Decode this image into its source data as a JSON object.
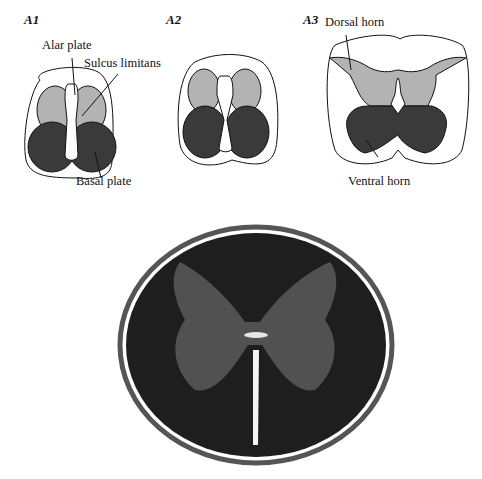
{
  "figure": {
    "panels": [
      {
        "id": "A1",
        "label": "A1"
      },
      {
        "id": "A2",
        "label": "A2"
      },
      {
        "id": "A3",
        "label": "A3"
      }
    ],
    "annotations": {
      "alar_plate": "Alar plate",
      "sulcus_limitans": "Sulcus limitans",
      "basal_plate": "Basal plate",
      "dorsal_horn": "Dorsal horn",
      "ventral_horn": "Ventral horn"
    },
    "colors": {
      "alar": "#b3b3b3",
      "basal": "#3a3a3a",
      "outline": "#111111",
      "background": "#ffffff"
    },
    "photo": {
      "description": "Histological cross-section of spinal cord"
    }
  }
}
